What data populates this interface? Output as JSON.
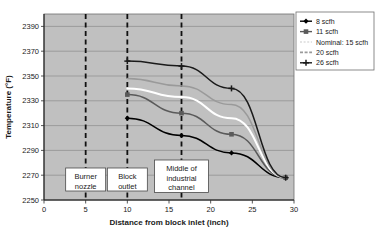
{
  "chart_data": {
    "type": "line",
    "title": "",
    "xlabel": "Distance from block inlet (inch)",
    "ylabel": "Temperature (°F)",
    "xlim": [
      0,
      30
    ],
    "ylim": [
      2250,
      2400
    ],
    "xticks": [
      0,
      5,
      10,
      15,
      20,
      25,
      30
    ],
    "yticks": [
      2250,
      2270,
      2290,
      2310,
      2330,
      2350,
      2370,
      2390
    ],
    "xtick_labels": [
      "0",
      "5",
      "10",
      "15",
      "20",
      "25",
      "30"
    ],
    "ytick_labels": [
      "2250",
      "2270",
      "2290",
      "2310",
      "2330",
      "2350",
      "2370",
      "2390"
    ],
    "grid": true,
    "grid_axis": "y",
    "plot_bgcolor": "#c0c0c0",
    "legend_position": "top-right",
    "series": [
      {
        "name": "8 scfh",
        "color": "#000000",
        "marker": "diamond",
        "style": "solid",
        "x": [
          10,
          16.5,
          22.5,
          29
        ],
        "y": [
          2316,
          2302,
          2288,
          2268
        ]
      },
      {
        "name": "11 scfh",
        "color": "#5a5a5a",
        "marker": "square",
        "style": "solid",
        "x": [
          10,
          16.5,
          22.5,
          29
        ],
        "y": [
          2335,
          2320,
          2303,
          2268
        ]
      },
      {
        "name": "Nominal: 15 scfh",
        "color": "#ffffff",
        "marker": "none",
        "style": "solid",
        "x": [
          10,
          16.5,
          22.5,
          29
        ],
        "y": [
          2340,
          2333,
          2316,
          2268
        ]
      },
      {
        "name": "20 scfh",
        "color": "#9a9a9a",
        "marker": "none",
        "style": "solid",
        "x": [
          10,
          16.5,
          22.5,
          29
        ],
        "y": [
          2348,
          2342,
          2327,
          2268
        ]
      },
      {
        "name": "26 scfh",
        "color": "#1a1a1a",
        "marker": "star",
        "style": "solid",
        "x": [
          10,
          16.5,
          22.5,
          29
        ],
        "y": [
          2362,
          2358,
          2340,
          2268
        ]
      }
    ],
    "reference_lines": [
      {
        "x": 5,
        "label": "Burner nozzle"
      },
      {
        "x": 10,
        "label": "Block outlet"
      },
      {
        "x": 16.5,
        "label": "Middle of industrial channel"
      }
    ],
    "annotations": [
      {
        "id": "burner-nozzle",
        "lines": [
          "Burner",
          "nozzle"
        ]
      },
      {
        "id": "block-outlet",
        "lines": [
          "Block",
          "outlet"
        ]
      },
      {
        "id": "middle-industrial-channel",
        "lines": [
          "Middle of",
          "industrial",
          "channel"
        ]
      }
    ]
  },
  "caption": "Distance from block inlet (inch)"
}
